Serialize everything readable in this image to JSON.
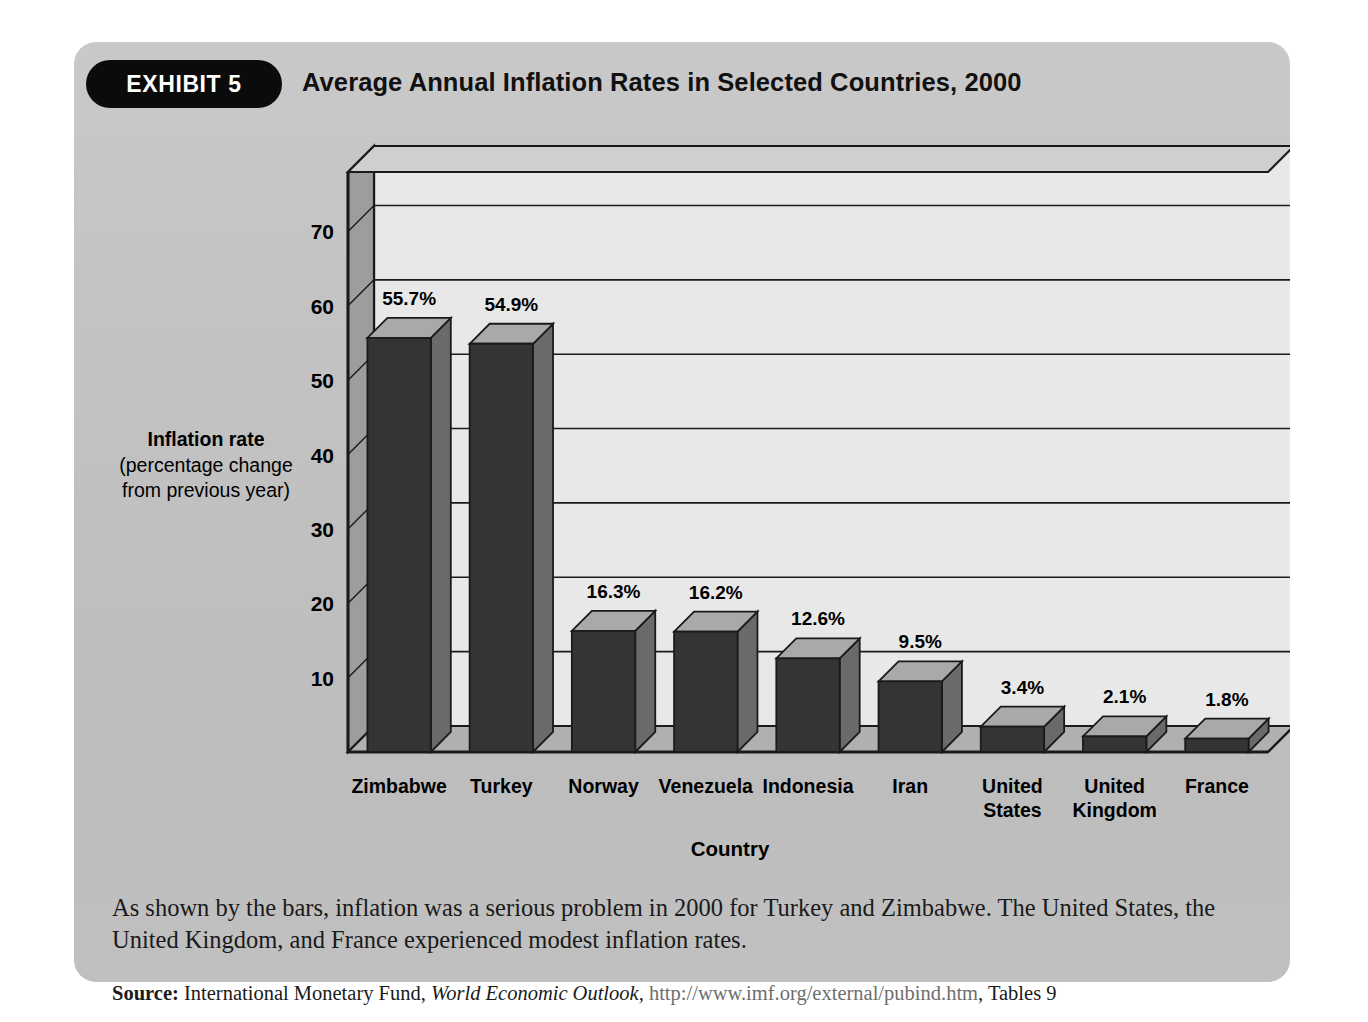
{
  "exhibit": {
    "badge": "EXHIBIT 5",
    "title": "Average Annual Inflation Rates in Selected Countries, 2000"
  },
  "axis": {
    "ylabel_main": "Inflation rate",
    "ylabel_sub": "(percentage change\nfrom previous year)",
    "xlabel": "Country"
  },
  "caption": "As shown by the bars, inflation was a serious problem in 2000 for Turkey and Zimbabwe. The United States, the United Kingdom, and France experienced modest inflation rates.",
  "source": {
    "label": "Source:",
    "org": "International Monetary Fund,",
    "publication": "World Economic Outlook,",
    "url": "http://www.imf.org/external/pubind.htm",
    "tables": ", Tables 9"
  },
  "colors": {
    "panel": "#c3c3c3",
    "badge": "#0b0b0b",
    "bar_front": "#343434",
    "bar_top": "#a9a9a9",
    "bar_side": "#6a6a6a",
    "plot_face": "#e8e8e8",
    "wall_side": "#9d9d9d",
    "floor": "#b0b0b0",
    "grid": "#1a1a1a"
  },
  "chart_data": {
    "type": "bar",
    "title": "Average Annual Inflation Rates in Selected Countries, 2000",
    "xlabel": "Country",
    "ylabel": "Inflation rate (percentage change from previous year)",
    "ylim": [
      0,
      78
    ],
    "yticks": [
      10,
      20,
      30,
      40,
      50,
      60,
      70
    ],
    "grid": true,
    "legend": "none",
    "categories": [
      "Zimbabwe",
      "Turkey",
      "Norway",
      "Venezuela",
      "Indonesia",
      "Iran",
      "United States",
      "United Kingdom",
      "France"
    ],
    "category_display": [
      "Zimbabwe",
      "Turkey",
      "Norway",
      "Venezuela",
      "Indonesia",
      "Iran",
      "United\nStates",
      "United\nKingdom",
      "France"
    ],
    "values": [
      55.7,
      54.9,
      16.3,
      16.2,
      12.6,
      9.5,
      3.4,
      2.1,
      1.8
    ],
    "value_labels": [
      "55.7%",
      "54.9%",
      "16.3%",
      "16.2%",
      "12.6%",
      "9.5%",
      "3.4%",
      "2.1%",
      "1.8%"
    ]
  }
}
